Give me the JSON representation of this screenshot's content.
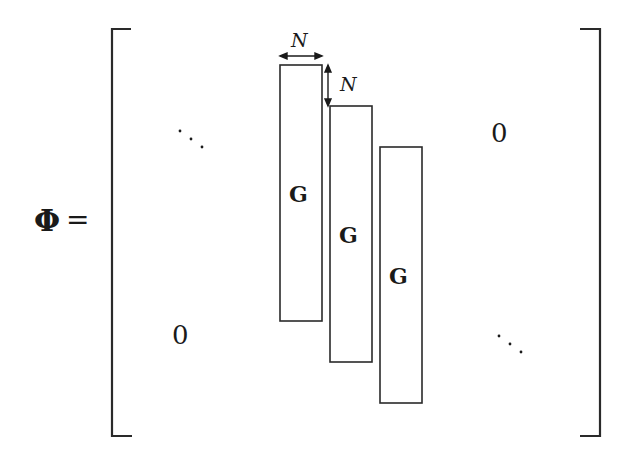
{
  "equation": {
    "lhs_symbol": "Φ",
    "equals": "=",
    "block_label": "G",
    "dimension_label": "N",
    "zero_upper_right": "0",
    "zero_lower_left": "0",
    "diag_dots_upper": "⋱",
    "diag_dots_lower": "⋱"
  },
  "blocks": [
    {
      "label": "G",
      "x": 280,
      "y": 65,
      "w": 42,
      "h": 256
    },
    {
      "label": "G",
      "x": 330,
      "y": 106,
      "w": 42,
      "h": 256
    },
    {
      "label": "G",
      "x": 380,
      "y": 147,
      "w": 42,
      "h": 256
    }
  ],
  "annotations": {
    "width_arrow": "N",
    "shift_arrow": "N"
  }
}
